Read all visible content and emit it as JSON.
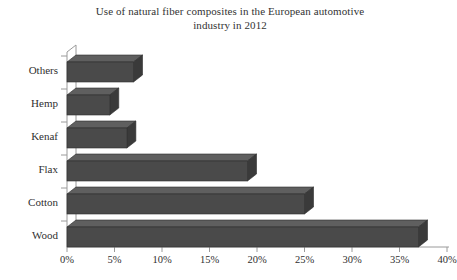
{
  "chart_data": {
    "type": "bar",
    "orientation": "horizontal",
    "title": "Use of natural fiber composites in the European automotive industry in 2012",
    "title_line1": "Use of natural fiber composites in the European automotive",
    "title_line2": "industry in 2012",
    "xlabel": "",
    "ylabel": "",
    "categories": [
      "Others",
      "Hemp",
      "Kenaf",
      "Flax",
      "Cotton",
      "Wood"
    ],
    "values": [
      7,
      4.5,
      6.3,
      19,
      25,
      37
    ],
    "value_unit": "%",
    "xlim": [
      0,
      40
    ],
    "xticks": [
      0,
      5,
      10,
      15,
      20,
      25,
      30,
      35,
      40
    ],
    "xtick_labels": [
      "0%",
      "5%",
      "10%",
      "15%",
      "20%",
      "25%",
      "30%",
      "35%",
      "40%"
    ],
    "grid": false,
    "legend": false,
    "style": "3d-extruded",
    "colors": {
      "bar_front": "#4a4a4a",
      "bar_top": "#5f5f5f",
      "bar_side": "#3a3a3a",
      "axis": "#9a9a9a",
      "text": "#2f2f2f"
    }
  }
}
